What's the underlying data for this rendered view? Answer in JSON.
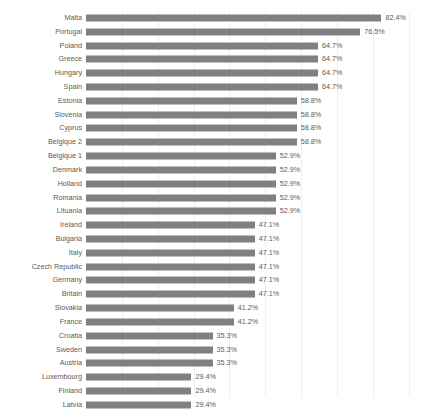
{
  "caption": {
    "text": "............................."
  },
  "axis": {
    "gridline_values": [
      10,
      20,
      30,
      40,
      50,
      60,
      70,
      80,
      90
    ],
    "x_min": 0,
    "x_max": 94,
    "tick_labels_visible": false
  },
  "chart_data": {
    "type": "bar",
    "orientation": "horizontal",
    "title": "",
    "subtitle": "",
    "xlabel": "",
    "ylabel": "",
    "xlim": [
      0,
      94
    ],
    "grid": true,
    "grid_axis": "x",
    "legend": false,
    "legend_position": "none",
    "value_suffix": "%",
    "bar_color": "#808080",
    "gridline_color": "#ededf2",
    "categories": [
      "Malta",
      "Portugal",
      "Poland",
      "Greece",
      "Hungary",
      "Spain",
      "Estonia",
      "Slovenia",
      "Cyprus",
      "Belgique 2",
      "Belgique 1",
      "Denmark",
      "Holland",
      "Romania",
      "Lituania",
      "Ireland",
      "Bulgaria",
      "Italy",
      "Czech Republic",
      "Germany",
      "Britain",
      "Slovakia",
      "France",
      "Croatia",
      "Sweden",
      "Austria",
      "Luxembourg",
      "Finland",
      "Latvia"
    ],
    "values": [
      82.4,
      76.5,
      64.7,
      64.7,
      64.7,
      64.7,
      58.8,
      58.8,
      58.8,
      58.8,
      52.9,
      52.9,
      52.9,
      52.9,
      52.9,
      47.1,
      47.1,
      47.1,
      47.1,
      47.1,
      47.1,
      41.2,
      41.2,
      35.3,
      35.3,
      35.3,
      29.4,
      29.4,
      29.4
    ],
    "data_labels": [
      "82.4%",
      "76.5%",
      "64.7%",
      "64.7%",
      "64.7%",
      "64.7%",
      "58.8%",
      "58.8%",
      "58.8%",
      "58.8%",
      "52.9%",
      "52.9%",
      "52.9%",
      "52.9%",
      "52.9%",
      "47.1%",
      "47.1%",
      "47.1%",
      "47.1%",
      "47.1%",
      "47.1%",
      "41.2%",
      "41.2%",
      "35.3%",
      "35.3%",
      "35.3%",
      "29.4%",
      "29.4%",
      "29.4%"
    ]
  }
}
